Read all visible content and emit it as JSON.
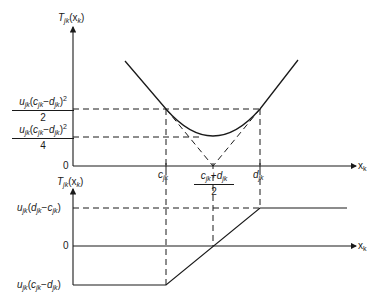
{
  "figure": {
    "top": {
      "y_axis_label": "T_jk(x_k)",
      "x_axis_label": "x_k",
      "y_ticks": [
        {
          "label": "u_jk(c_jk − d_jk)^2 / 2",
          "numerator": "u_jk(c_jk − d_jk)^2",
          "denominator": "2"
        },
        {
          "label": "u_jk(c_jk − d_jk)^2 / 4",
          "numerator": "u_jk(c_jk − d_jk)^2",
          "denominator": "4"
        },
        {
          "label": "0"
        }
      ],
      "x_ticks": [
        {
          "label": "c_jk"
        },
        {
          "label": "(c_jk + d_jk) / 2",
          "numerator": "c_jk + d_jk",
          "denominator": "2"
        },
        {
          "label": "d_jk"
        }
      ],
      "curve": "piecewise: linear decreasing, quadratic between c_jk and d_jk, linear increasing",
      "dashed_guides": "tangent lines meeting at (c_jk+d_jk)/2 on x-axis"
    },
    "bottom": {
      "y_axis_label": "T'_jk(x_k)",
      "x_axis_label": "x_k",
      "y_ticks": [
        {
          "label": "u_jk(d_jk − c_jk)"
        },
        {
          "label": "0"
        },
        {
          "label": "u_jk(c_jk − d_jk)"
        }
      ],
      "curve": "constant u_jk(c_jk − d_jk) until c_jk, linear rise through 0 at midpoint, constant u_jk(d_jk − c_jk) after d_jk"
    }
  },
  "labels": {
    "t_top_T": "T",
    "t_top_sub": "jk",
    "t_top_arg": "(x",
    "t_top_argsub": "k",
    "t_top_close": ")",
    "t_bot_T": "T",
    "t_bot_prime": "'",
    "t_bot_sub": "jk",
    "t_bot_arg": "(x",
    "t_bot_argsub": "k",
    "t_bot_close": ")",
    "x": "x",
    "k": "k",
    "jk": "jk",
    "u": "u",
    "c": "c",
    "d": "d",
    "lp": "(",
    "rp": ")",
    "minus": "−",
    "plus": "+",
    "sq": "2",
    "two": "2",
    "four": "4",
    "zero": "0"
  }
}
